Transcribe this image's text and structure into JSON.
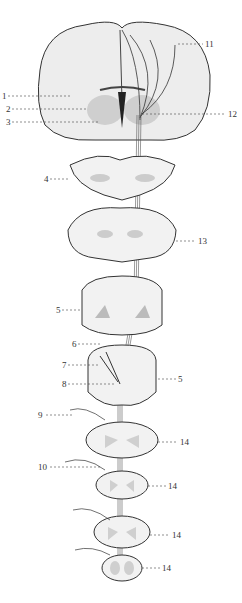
{
  "diagram": {
    "labels": [
      {
        "id": "1",
        "text": "1",
        "x": 2,
        "y": 92
      },
      {
        "id": "2",
        "text": "2",
        "x": 6,
        "y": 105
      },
      {
        "id": "3",
        "text": "3",
        "x": 6,
        "y": 118
      },
      {
        "id": "4",
        "text": "4",
        "x": 44,
        "y": 175
      },
      {
        "id": "5a",
        "text": "5",
        "x": 56,
        "y": 306
      },
      {
        "id": "6",
        "text": "6",
        "x": 72,
        "y": 340
      },
      {
        "id": "7",
        "text": "7",
        "x": 62,
        "y": 361
      },
      {
        "id": "8",
        "text": "8",
        "x": 62,
        "y": 380
      },
      {
        "id": "5b",
        "text": "5",
        "x": 178,
        "y": 375
      },
      {
        "id": "9",
        "text": "9",
        "x": 38,
        "y": 411
      },
      {
        "id": "10",
        "text": "10",
        "x": 38,
        "y": 463
      },
      {
        "id": "11",
        "text": "11",
        "x": 205,
        "y": 40
      },
      {
        "id": "12",
        "text": "12",
        "x": 228,
        "y": 110
      },
      {
        "id": "13",
        "text": "13",
        "x": 198,
        "y": 237
      },
      {
        "id": "14a",
        "text": "14",
        "x": 180,
        "y": 438
      },
      {
        "id": "14b",
        "text": "14",
        "x": 168,
        "y": 482
      },
      {
        "id": "14c",
        "text": "14",
        "x": 172,
        "y": 531
      },
      {
        "id": "14d",
        "text": "14",
        "x": 162,
        "y": 564
      }
    ]
  }
}
